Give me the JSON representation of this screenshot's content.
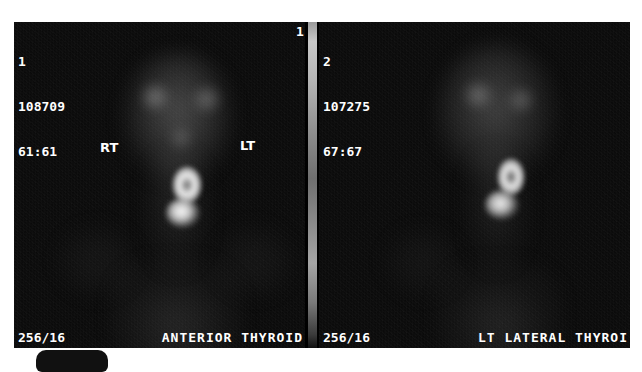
{
  "study": {
    "modality": "thyroid-scintigraphy",
    "frame": {
      "colorbar_index": "1"
    }
  },
  "panels": [
    {
      "id": "anterior",
      "header": {
        "index": "1",
        "counts": "108709",
        "window": "61:61"
      },
      "footer": {
        "matrix": "256/16",
        "view_label": "ANTERIOR THYROID"
      },
      "markers": {
        "right_label": "RT",
        "left_label": "LT"
      }
    },
    {
      "id": "lt-lateral",
      "header": {
        "index": "2",
        "counts": "107275",
        "window": "67:67"
      },
      "footer": {
        "matrix": "256/16",
        "view_label": "LT LATERAL THYROI"
      }
    }
  ],
  "colors": {
    "background": "#ffffff",
    "image_background": "#000000",
    "overlay_text": "#ffffff",
    "frame_underline": "#c9c9c9",
    "bottom_tab": "#111111"
  }
}
